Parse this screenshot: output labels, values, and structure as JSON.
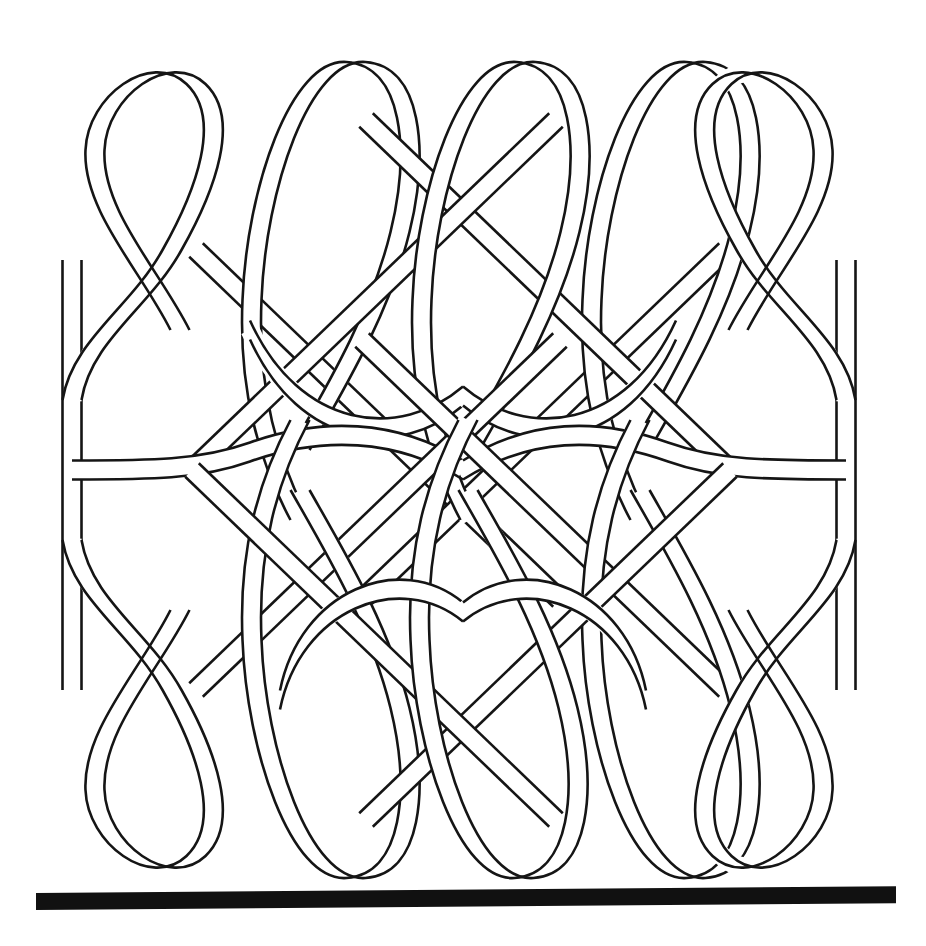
{
  "figure": {
    "kind": "line-art-knot-diagram",
    "description": "Black-and-white outline drawing of a single continuous interlaced band woven into a square panel, with five teardrop loops along the top edge, five along the bottom edge, straight vertical bands down the left and right edges, and a thick solid black horizontal bar beneath the panel.",
    "background_color": "#ffffff",
    "line_color": "#151515",
    "bar_color": "#111111",
    "canvas": {
      "width": 926,
      "height": 946
    }
  },
  "geometry": {
    "band_half_width": 9.5,
    "outline_stroke_width": 2.6,
    "casing_stroke_width": 19,
    "panel": {
      "left": 62,
      "right": 864,
      "top": 58,
      "bottom": 880
    },
    "top_loop_centers_x": [
      120,
      300,
      470,
      640,
      822
    ],
    "bottom_loop_centers_x": [
      122,
      300,
      468,
      640,
      822
    ],
    "top_loop_apex_y": 62,
    "bottom_loop_apex_y": 876,
    "side_band_left_x": 72,
    "side_band_right_x": 846,
    "side_band_top_y": 238,
    "side_band_bottom_y": 712
  },
  "baseline_bar": {
    "label": "baseline-bar",
    "x": 36,
    "y": 890,
    "width": 860,
    "height": 17,
    "skew_deg": -0.45,
    "color": "#111111"
  },
  "chart_data": {
    "type": "line",
    "xlabel": "",
    "ylabel": "",
    "series": [
      {
        "name": "top-loops",
        "x": [
          120,
          300,
          470,
          640,
          822
        ],
        "values": [
          62,
          62,
          62,
          62,
          62
        ]
      },
      {
        "name": "bottom-loops",
        "x": [
          122,
          300,
          468,
          640,
          822
        ],
        "values": [
          876,
          876,
          876,
          876,
          876
        ]
      }
    ]
  }
}
